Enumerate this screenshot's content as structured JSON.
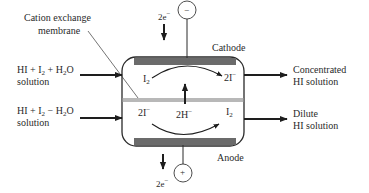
{
  "diagram": {
    "type": "electrodialysis cell schematic",
    "labels": {
      "membrane": [
        "Cation exchange",
        "membrane"
      ],
      "cathode": "Cathode",
      "anode": "Anode",
      "inlet_top": {
        "formula": "HI + I₂ + H₂O",
        "line2": "solution"
      },
      "inlet_bottom": {
        "formula": "HI + I₂ − H₂O",
        "line2": "solution"
      },
      "outlet_top": [
        "Concentrated",
        "HI solution"
      ],
      "outlet_bottom": [
        "Dilute",
        "HI solution"
      ],
      "electron_top": "2e⁻",
      "electron_bottom": "2e⁻",
      "terminal_top": "−",
      "terminal_bottom": "+",
      "cathode_reactant": "I₂",
      "cathode_product": "2I⁻",
      "anode_reactant": "2I⁻",
      "anode_product": "I₂",
      "proton_transport": "2H⁻"
    },
    "colors": {
      "electrode": "#6b6b6b",
      "membrane": "#b8b8b8",
      "line": "#2a2a2a",
      "background": "#ffffff"
    }
  }
}
